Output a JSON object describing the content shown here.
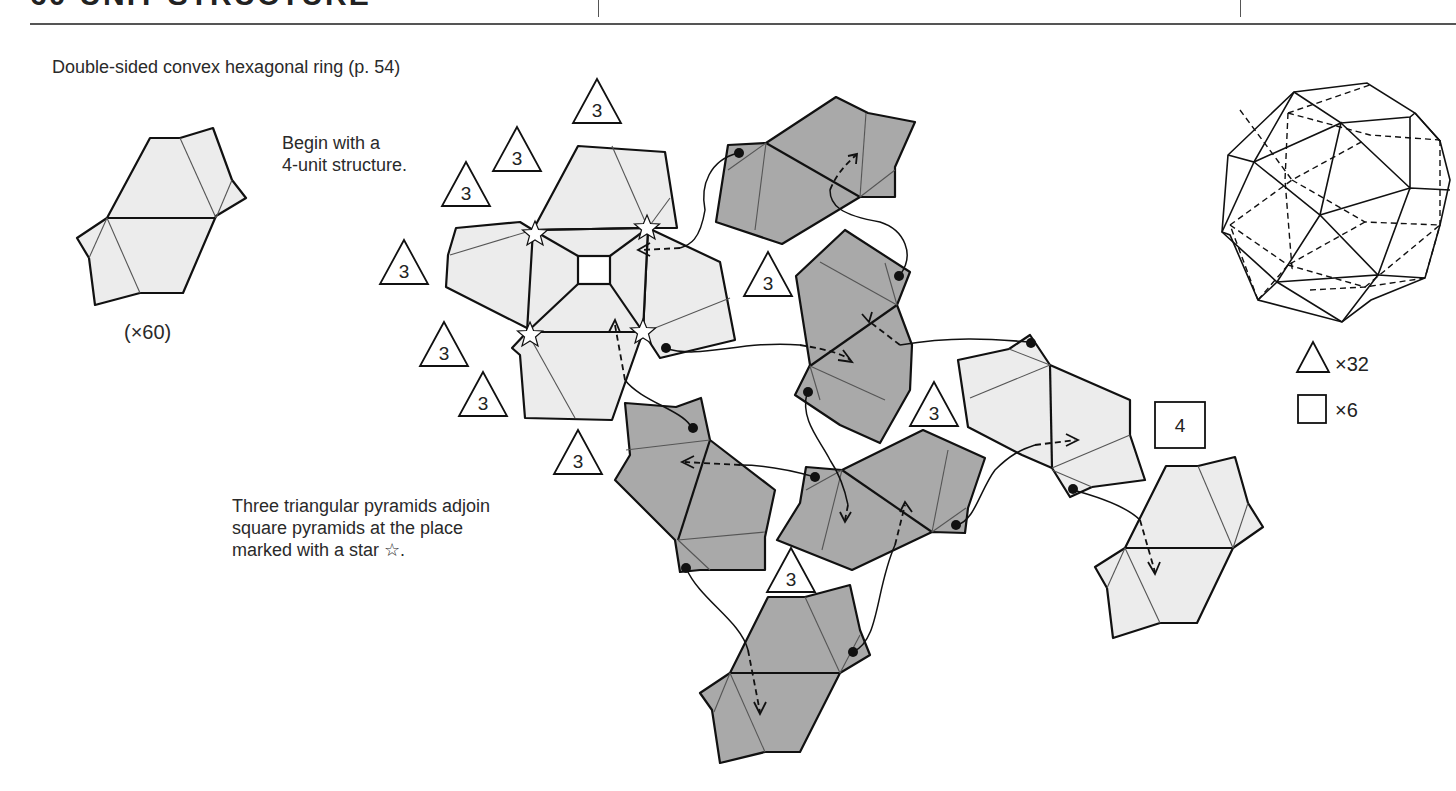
{
  "header": {
    "title": "60-UNIT STRUCTURE"
  },
  "captions": {
    "unit_name": "Double-sided convex hexagonal ring (p. 54)",
    "unit_count": "(×60)",
    "begin_line1": "Begin with a",
    "begin_line2": "4-unit structure.",
    "note_line1": "Three triangular pyramids adjoin",
    "note_line2": "square pyramids at the place",
    "note_line3": "marked with a star ☆."
  },
  "badges": {
    "triangle_label": "3",
    "square_label": "4"
  },
  "legend": {
    "triangle_count": "×32",
    "square_count": "×6"
  },
  "colors": {
    "light_unit": "#ececec",
    "dark_unit": "#a9a9a9",
    "line": "#111111"
  }
}
